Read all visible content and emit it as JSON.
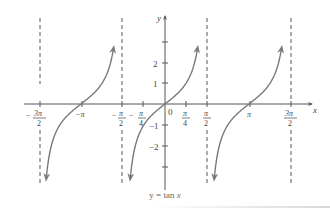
{
  "chart_data": {
    "type": "line",
    "title": "y = tan x",
    "function": "tan(x)",
    "xlabel": "x",
    "ylabel": "y",
    "x_range": [
      -4.9,
      5.1
    ],
    "y_range": [
      -3.8,
      3.6
    ],
    "grid": false,
    "x_ticks": [
      {
        "value": -4.712,
        "label": "-3π/2"
      },
      {
        "value": -3.1416,
        "label": "-π"
      },
      {
        "value": -1.5708,
        "label": "-π/2"
      },
      {
        "value": -0.7854,
        "label": "-π/4"
      },
      {
        "value": 0,
        "label": "0"
      },
      {
        "value": 0.7854,
        "label": "π/4"
      },
      {
        "value": 1.5708,
        "label": "π/2"
      },
      {
        "value": 3.1416,
        "label": "π"
      },
      {
        "value": 4.712,
        "label": "3π/2"
      }
    ],
    "y_ticks": [
      {
        "value": 3,
        "label": ""
      },
      {
        "value": 2,
        "label": "2"
      },
      {
        "value": 1,
        "label": "1"
      },
      {
        "value": -1,
        "label": "-1"
      },
      {
        "value": -2,
        "label": "-2"
      },
      {
        "value": -3,
        "label": ""
      }
    ],
    "asymptotes": [
      {
        "x": -4.712,
        "label": "x = -3π/2"
      },
      {
        "x": -1.5708,
        "label": "x = -π/2"
      },
      {
        "x": 1.5708,
        "label": "x = π/2"
      },
      {
        "x": 4.712,
        "label": "x = 3π/2"
      }
    ],
    "branches": [
      {
        "from": -4.712,
        "to": -1.5708,
        "zero": -3.1416
      },
      {
        "from": -1.5708,
        "to": 1.5708,
        "zero": 0
      },
      {
        "from": 1.5708,
        "to": 4.712,
        "zero": 3.1416
      }
    ],
    "sample_points": [
      {
        "x": -0.7854,
        "y": -1
      },
      {
        "x": 0,
        "y": 0
      },
      {
        "x": 0.7854,
        "y": 1
      },
      {
        "x": 3.1416,
        "y": 0
      },
      {
        "x": -3.1416,
        "y": 0
      }
    ],
    "colors": {
      "curve": "#7a7a7a",
      "axes": "#555555",
      "asymptote": "#444444",
      "text": "#444444"
    }
  },
  "labels": {
    "x_axis": "x",
    "y_axis": "y",
    "origin": "0",
    "y_one": "1",
    "y_two": "2",
    "y_neg_one": "−1",
    "y_neg_two": "−2",
    "neg_pi": "−π",
    "pi": "π",
    "pi_num": "π",
    "pi_2_den": "2",
    "pi_4_den": "4",
    "three_pi_num": "3π",
    "minus": "−"
  },
  "caption": {
    "prefix": "y = tan ",
    "var": "x"
  }
}
